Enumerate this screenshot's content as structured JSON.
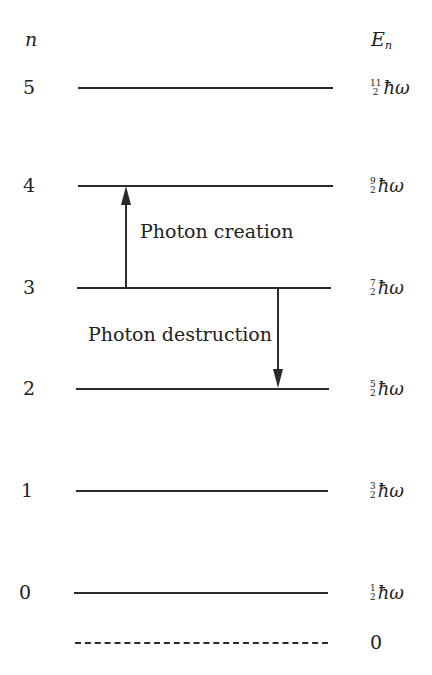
{
  "header": {
    "n_label": "n",
    "energy_label": "E",
    "energy_sub": "n"
  },
  "levels": [
    {
      "n": "5",
      "num": "11",
      "den": "2",
      "unit": "ħω",
      "y": 88
    },
    {
      "n": "4",
      "num": "9",
      "den": "2",
      "unit": "ħω",
      "y": 186
    },
    {
      "n": "3",
      "num": "7",
      "den": "2",
      "unit": "ħω",
      "y": 288
    },
    {
      "n": "2",
      "num": "5",
      "den": "2",
      "unit": "ħω",
      "y": 389
    },
    {
      "n": "1",
      "num": "3",
      "den": "2",
      "unit": "ħω",
      "y": 491
    },
    {
      "n": "0",
      "num": "1",
      "den": "2",
      "unit": "ħω",
      "y": 593
    }
  ],
  "zero_level": {
    "label": "0",
    "y": 643,
    "style": "dashed"
  },
  "transitions": [
    {
      "label": "Photon creation",
      "from": 3,
      "to": 4,
      "direction": "up"
    },
    {
      "label": "Photon destruction",
      "from": 3,
      "to": 2,
      "direction": "down"
    }
  ],
  "colors": {
    "line": "#2a2a2a",
    "text": "#222222",
    "background": "#ffffff"
  }
}
